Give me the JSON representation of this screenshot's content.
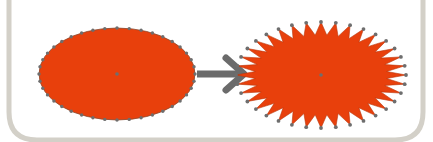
{
  "diagram": {
    "colors": {
      "background": "#ffffff",
      "frame": "#d3d0c8",
      "fill": "#e8400c",
      "node": "#6e6e6e",
      "arrow": "#6b6b6b"
    },
    "source_shape": {
      "name": "ellipse",
      "cx": 117,
      "cy": 74,
      "rx": 78,
      "ry": 46,
      "vertex_count": 40
    },
    "arrow": {
      "from_x": 197,
      "to_x": 246,
      "y": 74
    },
    "target_shape": {
      "name": "starburst-ellipse",
      "cx": 321,
      "cy": 75,
      "outer_rx": 85,
      "outer_ry": 53,
      "inner_rx": 66,
      "inner_ry": 40,
      "spikes": 36
    }
  }
}
